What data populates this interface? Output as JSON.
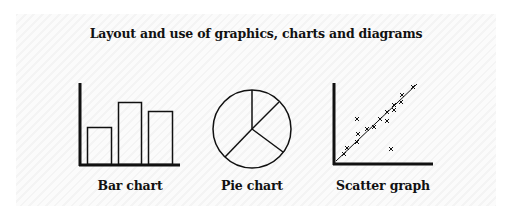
{
  "title": "Layout and use of graphics, charts and diagrams",
  "captions": {
    "bar": "Bar chart",
    "pie": "Pie chart",
    "scatter": "Scatter graph"
  },
  "colors": {
    "ink": "#111111",
    "background": "#ffffff",
    "hatch": "#f4f4f4"
  },
  "chart_data": [
    {
      "type": "bar",
      "title": "Bar chart",
      "categories": [
        "1",
        "2",
        "3"
      ],
      "values": [
        38,
        63,
        54
      ],
      "xlabel": "",
      "ylabel": "",
      "note": "Schematic icon, no ticks or axis labels"
    },
    {
      "type": "pie",
      "title": "Pie chart",
      "labels": [
        "A",
        "B",
        "C",
        "D"
      ],
      "values": [
        12,
        23,
        30,
        35
      ],
      "note": "Schematic icon, 4 unlabeled slices"
    },
    {
      "type": "scatter",
      "title": "Scatter graph",
      "points": [
        [
          10,
          10
        ],
        [
          13,
          16
        ],
        [
          23,
          22
        ],
        [
          24,
          30
        ],
        [
          23,
          45
        ],
        [
          33,
          35
        ],
        [
          40,
          37
        ],
        [
          46,
          45
        ],
        [
          53,
          52
        ],
        [
          53,
          43
        ],
        [
          60,
          59
        ],
        [
          60,
          54
        ],
        [
          67,
          62
        ],
        [
          68,
          69
        ],
        [
          79,
          77
        ],
        [
          57,
          15
        ]
      ],
      "trendline": [
        [
          2,
          2
        ],
        [
          84,
          80
        ]
      ],
      "xlabel": "",
      "ylabel": "",
      "note": "Schematic icon with line of best fit, one outlier"
    }
  ]
}
